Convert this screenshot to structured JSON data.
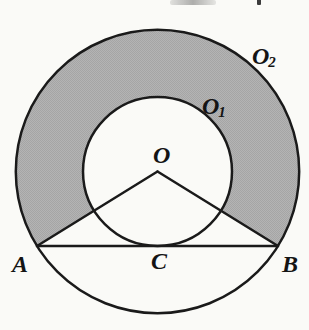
{
  "figure": {
    "labels": {
      "center": "O",
      "inner_circle_base": "O",
      "inner_circle_sub": "1",
      "outer_circle_base": "O",
      "outer_circle_sub": "2",
      "point_a": "A",
      "point_b": "B",
      "point_c": "C"
    },
    "geometry": {
      "circles": [
        {
          "label": "O1",
          "role": "inner circle, tangent to chord AB at C"
        },
        {
          "label": "O2",
          "role": "outer circle, passes through A and B"
        }
      ],
      "points": {
        "O": "common center of both circles",
        "A": "left endpoint of chord on outer circle",
        "B": "right endpoint of chord on outer circle",
        "C": "tangency point of chord AB with inner circle"
      },
      "segments": [
        "OA",
        "OB",
        "AB"
      ],
      "shaded_region": "annulus between the circles above segments OA and OB"
    },
    "colors": {
      "shade": "#b4b4b4",
      "shade_dot": "#a5a5a5",
      "line": "#1a1a1a",
      "paper": "#fafaf7"
    }
  }
}
